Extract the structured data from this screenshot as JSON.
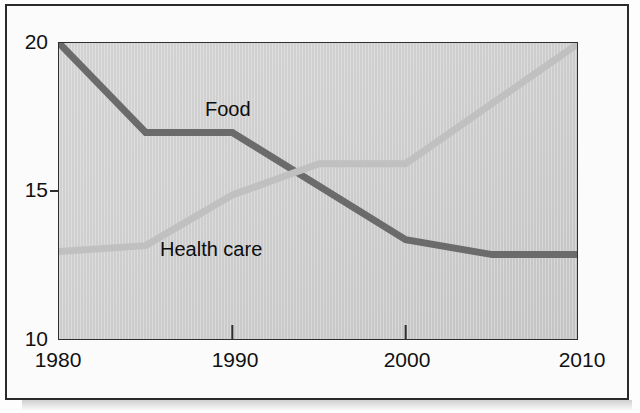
{
  "figure": {
    "background_color": "#fdfdfd",
    "plot_background_color": "#cfcfcf",
    "border_color": "#2a2a2a"
  },
  "chart_data": {
    "type": "line",
    "title": "",
    "subtitle": "",
    "xlabel": "",
    "ylabel": "",
    "xlim": [
      1980,
      2010
    ],
    "ylim": [
      10,
      20
    ],
    "xticks": [
      1980,
      1990,
      2000,
      2010
    ],
    "xtick_labels": [
      "1980",
      "1990",
      "2000",
      "2010"
    ],
    "yticks": [
      10,
      15,
      20
    ],
    "ytick_labels": [
      "10",
      "15",
      "20"
    ],
    "grid": false,
    "legend": "inline-labels",
    "legend_position": "in-plot",
    "series": [
      {
        "name": "Food",
        "color": "#6b6b6b",
        "label_text": "Food",
        "line_width": 7,
        "x": [
          1980,
          1985,
          1990,
          2000,
          2005,
          2010
        ],
        "values": [
          20.0,
          17.0,
          17.0,
          13.4,
          12.9,
          12.9
        ]
      },
      {
        "name": "Health care",
        "color": "#c0c0c0",
        "label_text": "Health care",
        "line_width": 7,
        "x": [
          1980,
          1985,
          1990,
          1995,
          2000,
          2010
        ],
        "values": [
          13.0,
          13.2,
          14.9,
          15.95,
          15.95,
          20.0
        ]
      }
    ],
    "annotations": [
      {
        "text": "Food",
        "x": 1991.5,
        "y": 18.2
      },
      {
        "text": "Health care",
        "x": 1989.0,
        "y": 13.5
      }
    ]
  },
  "axes": {
    "y_labels": {
      "top": "20",
      "middle": "15",
      "bottom": "10"
    },
    "x_labels": {
      "first": "1980",
      "second": "1990",
      "third": "2000",
      "fourth": "2010"
    }
  },
  "series_labels": {
    "food": "Food",
    "health_care": "Health care"
  }
}
